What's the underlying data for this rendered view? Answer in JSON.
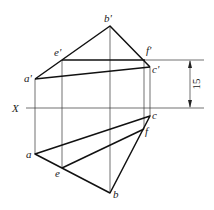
{
  "diagram": {
    "axis_label": "X",
    "dimension_value": "15",
    "front_view_points": {
      "a": "a'",
      "b": "b'",
      "c": "c'",
      "e": "e'",
      "f": "f'"
    },
    "top_view_points": {
      "a": "a",
      "b": "b",
      "c": "c",
      "e": "e",
      "f": "f"
    },
    "line_color": "#111111"
  }
}
